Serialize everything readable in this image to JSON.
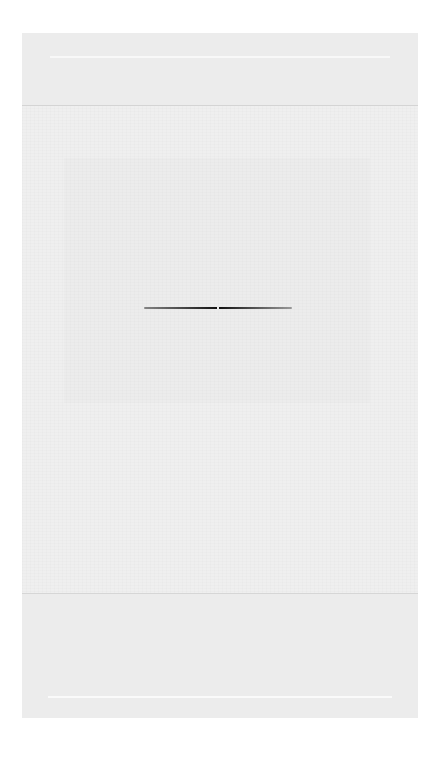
{
  "page": {
    "header": {},
    "body": {
      "ornament": "section-divider"
    },
    "footer": {}
  },
  "colors": {
    "page_bg": "#efefef",
    "band_bg": "#ececec",
    "divider": "#111111"
  }
}
